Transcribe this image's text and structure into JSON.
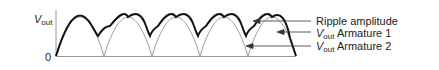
{
  "diagram": {
    "y_axis_label": {
      "main": "V",
      "sub": "out"
    },
    "origin_label": "0",
    "legend": [
      {
        "id": "ripple",
        "text": "Ripple amplitude",
        "prefix": null
      },
      {
        "id": "arm1",
        "text": "Armature 1",
        "prefix": {
          "main": "V",
          "sub": "out"
        }
      },
      {
        "id": "arm2",
        "text": "Armature 2",
        "prefix": {
          "main": "V",
          "sub": "out"
        }
      }
    ],
    "colors": {
      "envelope": "#111111",
      "armature": "#888888",
      "axis": "#999999",
      "arrow": "#333333"
    }
  }
}
